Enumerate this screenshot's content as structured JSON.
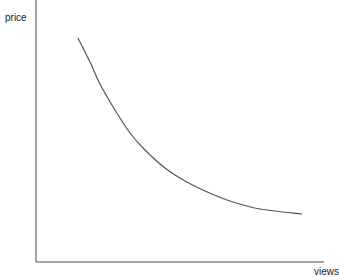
{
  "chart_data": {
    "type": "line",
    "title": "",
    "xlabel": "views",
    "ylabel": "price",
    "grid": false,
    "legend": null,
    "ticks": false,
    "series": [
      {
        "name": "price vs views",
        "color": "#555555",
        "points_px": [
          [
            78,
            38
          ],
          [
            90,
            62
          ],
          [
            100,
            84
          ],
          [
            115,
            110
          ],
          [
            130,
            133
          ],
          [
            145,
            150
          ],
          [
            165,
            168
          ],
          [
            185,
            181
          ],
          [
            205,
            191
          ],
          [
            230,
            201
          ],
          [
            260,
            209
          ],
          [
            302,
            214
          ]
        ]
      }
    ]
  },
  "axes": {
    "y_label": "price",
    "x_label": "views",
    "color": "#444444"
  }
}
